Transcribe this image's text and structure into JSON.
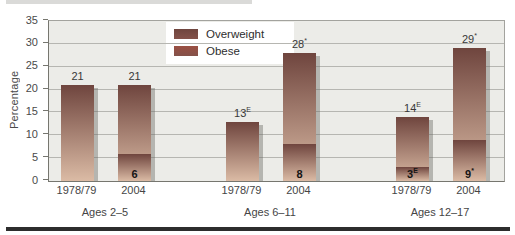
{
  "figure": {
    "ylabel": "Percentage"
  },
  "chart_data": {
    "type": "bar",
    "stacked": true,
    "ylabel": "Percentage",
    "ylim": [
      0,
      35
    ],
    "yticks": [
      0,
      5,
      10,
      15,
      20,
      25,
      30,
      35
    ],
    "grid": true,
    "legend_position": "top-center",
    "legend_items": [
      {
        "label": "Overweight"
      },
      {
        "label": "Obese"
      }
    ],
    "note": "Totals shown above bars are combined overweight+obese percentage; bold numbers inside bars are the obese percentage.",
    "groups": [
      {
        "label": "Ages 2–5",
        "bars": [
          {
            "year": "1978/79",
            "total": 21,
            "label": "21",
            "sup": "",
            "obese": null,
            "obese_label": "",
            "obese_sup": ""
          },
          {
            "year": "2004",
            "total": 21,
            "label": "21",
            "sup": "",
            "obese": 6,
            "obese_label": "6",
            "obese_sup": ""
          }
        ]
      },
      {
        "label": "Ages 6–11",
        "bars": [
          {
            "year": "1978/79",
            "total": 13,
            "label": "13",
            "sup": "E",
            "obese": null,
            "obese_label": "",
            "obese_sup": ""
          },
          {
            "year": "2004",
            "total": 28,
            "label": "28",
            "sup": "*",
            "obese": 8,
            "obese_label": "8",
            "obese_sup": ""
          }
        ]
      },
      {
        "label": "Ages 12–17",
        "bars": [
          {
            "year": "1978/79",
            "total": 14,
            "label": "14",
            "sup": "E",
            "obese": 3,
            "obese_label": "3",
            "obese_sup": "E"
          },
          {
            "year": "2004",
            "total": 29,
            "label": "29",
            "sup": "*",
            "obese": 9,
            "obese_label": "9",
            "obese_sup": "*"
          }
        ]
      }
    ],
    "colors": {
      "bar_gradient_top": "#6f453e",
      "bar_gradient_bottom": "#dbbba5",
      "overweight_swatch": "#84524a",
      "obese_swatch": "#9a4f42",
      "plot_background": "#ecece8",
      "gridline": "#b6b6b1",
      "axis": "#76766f",
      "bottom_rule": "#2d2d2d",
      "top_strip": "#dadad8"
    }
  }
}
